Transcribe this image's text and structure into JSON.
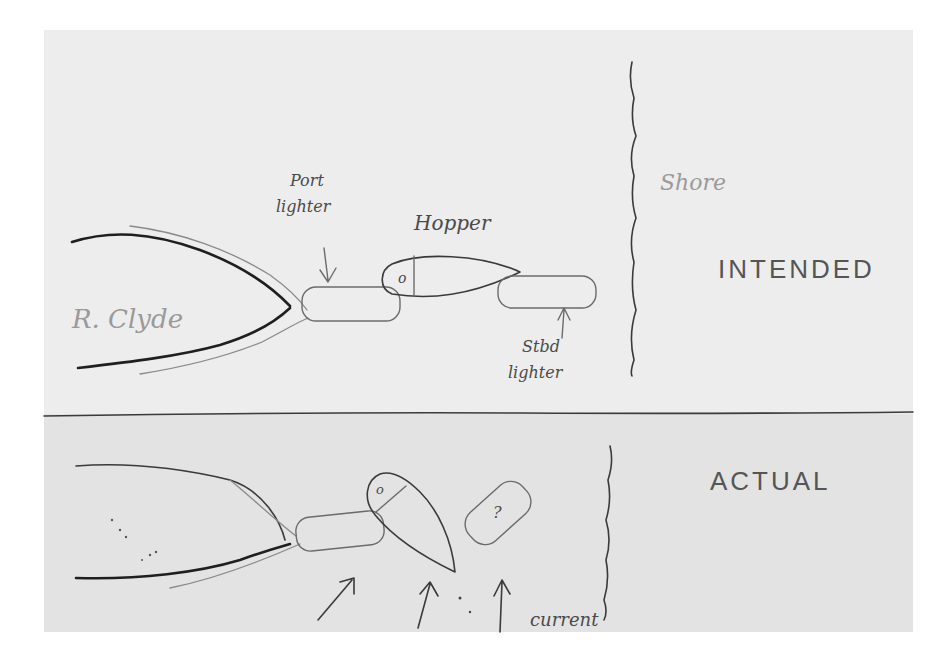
{
  "diagram": {
    "colors": {
      "background": "#ffffff",
      "paper_top": "#ececec",
      "paper_bottom": "#e2e2e2",
      "ink": "#2a2a2a"
    },
    "intended": {
      "section_label": "INTENDED",
      "river_label": "R. Clyde",
      "port_lighter_label_line1": "Port",
      "port_lighter_label_line2": "lighter",
      "hopper_label": "Hopper",
      "hopper_marker": "o",
      "stbd_lighter_label_line1": "Stbd",
      "stbd_lighter_label_line2": "lighter",
      "shore_label": "Shore"
    },
    "actual": {
      "section_label": "ACTUAL",
      "hopper_marker": "o",
      "unknown_vessel_marker": "?",
      "current_label": "current"
    }
  }
}
